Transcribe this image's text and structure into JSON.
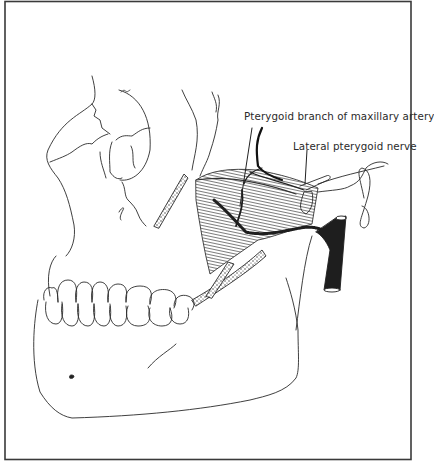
{
  "figure": {
    "labels": [
      {
        "id": "pterygoid-branch",
        "text": "Pterygoid branch of maxillary artery"
      },
      {
        "id": "lateral-pterygoid-nerve",
        "text": "Lateral pterygoid nerve"
      }
    ],
    "colors": {
      "line": "#2a2a2a",
      "frame": "#3a3a3a",
      "background": "#ffffff",
      "vessel": "#1e1e1e"
    }
  }
}
